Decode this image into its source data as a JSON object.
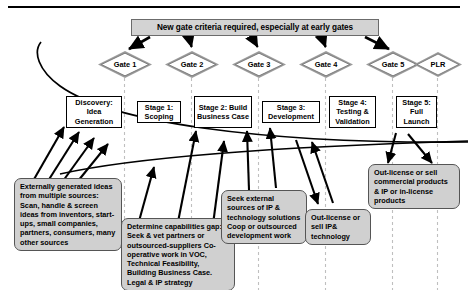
{
  "diagram": {
    "title_banner": "New gate criteria required, especially at early gates",
    "gates": [
      {
        "label": "Gate 1"
      },
      {
        "label": "Gate 2"
      },
      {
        "label": "Gate 3"
      },
      {
        "label": "Gate 4"
      },
      {
        "label": "Gate 5"
      },
      {
        "label": "PLR"
      }
    ],
    "stages": [
      {
        "label": "Discovery: Idea Generation"
      },
      {
        "label": "Stage 1: Scoping"
      },
      {
        "label": "Stage 2: Build Business Case"
      },
      {
        "label": "Stage 3: Development"
      },
      {
        "label": "Stage 4: Testing & Validation"
      },
      {
        "label": "Stage 5: Full Launch"
      }
    ],
    "callouts": [
      {
        "text": "Externally generated ideas from multiple sources: Scan, handle & screen ideas from inventors, start-ups, small companies, partners, consumers, many other sources"
      },
      {
        "text": "Determine capabilities gap: Seek & vet partners or outsourced-suppliers Co-operative work in VOC, Technical Feasibility, Building Business Case. Legal & IP strategy"
      },
      {
        "text": "Seek external sources of IP & technology solutions Coop or outsourced development work"
      },
      {
        "text": "Out-license or sell IP& technology"
      },
      {
        "text": "Out-license or sell commercial products & IP or in-license products"
      }
    ],
    "colors": {
      "banner_fill": "#d3d3d3",
      "callout_fill": "#d0d0d0",
      "gate_fill": "#ffffff",
      "line": "#000000",
      "divider": "#bfbfbf"
    }
  }
}
